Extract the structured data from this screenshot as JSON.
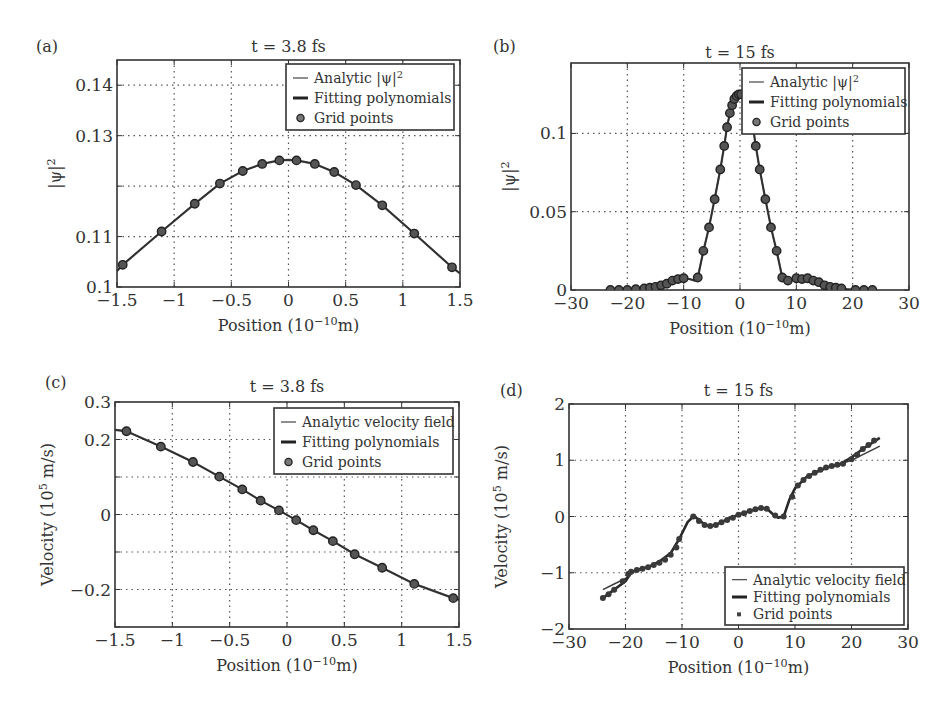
{
  "figure": {
    "panel_labels": [
      "(a)",
      "(b)",
      "(c)",
      "(d)"
    ]
  },
  "chart_data": [
    {
      "id": "a",
      "type": "line",
      "panel_label": "(a)",
      "title": "t = 3.8 fs",
      "xlabel": "Position (10",
      "xlabel_sup": "−10",
      "xlabel_tail": "m)",
      "ylabel": "|ψ|",
      "ylabel_sup": "2",
      "xlim": [
        -1.5,
        1.5
      ],
      "ylim": [
        0.1,
        0.145
      ],
      "xticks": [
        -1.5,
        -1,
        -0.5,
        0,
        0.5,
        1,
        1.5
      ],
      "xtick_labels": [
        "−1.5",
        "−1",
        "−0.5",
        "0",
        "0.5",
        "1",
        "1.5"
      ],
      "yticks": [
        0.1,
        0.11,
        0.12,
        0.13,
        0.14
      ],
      "ytick_labels": [
        "0.1",
        "0.11",
        "",
        "0.13",
        "0.14"
      ],
      "grid": true,
      "legend_position": "top-right",
      "legend": [
        {
          "label": "Analytic |ψ|",
          "sup": "2",
          "style": "thin-line"
        },
        {
          "label": "Fitting polynomials",
          "sup": "",
          "style": "thick-line"
        },
        {
          "label": "Grid points",
          "sup": "",
          "style": "marker"
        }
      ],
      "series": [
        {
          "name": "Analytic |ψ|^2",
          "kind": "curve",
          "x": [
            -1.5,
            -1.45,
            -1.11,
            -0.82,
            -0.6,
            -0.4,
            -0.23,
            -0.08,
            0.0,
            0.07,
            0.23,
            0.4,
            0.59,
            0.82,
            1.1,
            1.43,
            1.5
          ],
          "y": [
            0.1032,
            0.1044,
            0.111,
            0.1165,
            0.1205,
            0.123,
            0.1244,
            0.1251,
            0.1252,
            0.1251,
            0.1244,
            0.1228,
            0.1202,
            0.1162,
            0.1106,
            0.1039,
            0.1027
          ]
        },
        {
          "name": "Grid points",
          "kind": "points",
          "x": [
            -1.45,
            -1.11,
            -0.82,
            -0.6,
            -0.4,
            -0.23,
            -0.08,
            0.07,
            0.23,
            0.4,
            0.59,
            0.82,
            1.1,
            1.43
          ],
          "y": [
            0.1044,
            0.111,
            0.1165,
            0.1205,
            0.123,
            0.1244,
            0.1251,
            0.1251,
            0.1244,
            0.1228,
            0.1202,
            0.1162,
            0.1106,
            0.1039
          ]
        }
      ]
    },
    {
      "id": "b",
      "type": "line",
      "panel_label": "(b)",
      "title": "t = 15 fs",
      "xlabel": "Position (10",
      "xlabel_sup": "−10",
      "xlabel_tail": "m)",
      "ylabel": "|ψ|",
      "ylabel_sup": "2",
      "xlim": [
        -30,
        30
      ],
      "ylim": [
        0,
        0.145
      ],
      "xticks": [
        -30,
        -20,
        -10,
        0,
        10,
        20,
        30
      ],
      "xtick_labels": [
        "−30",
        "−20",
        "−10",
        "0",
        "10",
        "20",
        "30"
      ],
      "yticks": [
        0,
        0.05,
        0.1
      ],
      "ytick_labels": [
        "0",
        "0.05",
        "0.1"
      ],
      "grid": true,
      "legend_position": "top-right",
      "legend": [
        {
          "label": "Analytic |ψ|",
          "sup": "2",
          "style": "thin-line"
        },
        {
          "label": "Fitting polynomials",
          "sup": "",
          "style": "thick-line"
        },
        {
          "label": "Grid points",
          "sup": "",
          "style": "marker"
        }
      ],
      "series": [
        {
          "name": "Analytic |ψ|^2",
          "kind": "curve",
          "x": [
            -23,
            -21.5,
            -20,
            -18.5,
            -17,
            -16,
            -15,
            -14,
            -13,
            -12,
            -11,
            -10,
            -9,
            -8,
            -7.5,
            -6.5,
            -5.5,
            -4.5,
            -3.5,
            -2.8,
            -2.3,
            -1.8,
            -1.4,
            -1,
            -0.6,
            -0.2,
            0.2,
            0.6,
            1,
            1.4,
            1.8,
            2.3,
            2.8,
            3.5,
            4.5,
            5.5,
            6.5,
            7.5,
            8.5,
            10,
            11,
            12,
            13,
            14,
            15,
            16,
            17,
            18,
            19,
            20.5,
            22,
            23.5
          ],
          "y": [
            0,
            0,
            0,
            0.0005,
            0.001,
            0.0015,
            0.002,
            0.003,
            0.004,
            0.006,
            0.007,
            0.0075,
            0.007,
            0.006,
            0.008,
            0.025,
            0.04,
            0.058,
            0.077,
            0.092,
            0.104,
            0.113,
            0.118,
            0.122,
            0.124,
            0.125,
            0.125,
            0.124,
            0.122,
            0.118,
            0.113,
            0.104,
            0.092,
            0.077,
            0.058,
            0.04,
            0.025,
            0.008,
            0.006,
            0.0075,
            0.007,
            0.0075,
            0.006,
            0.005,
            0.003,
            0.002,
            0.0015,
            0.001,
            0.0005,
            0,
            0,
            0
          ]
        },
        {
          "name": "Grid points",
          "kind": "points",
          "x": [
            -23,
            -21.5,
            -20,
            -18.5,
            -17,
            -16,
            -15,
            -14,
            -13,
            -12,
            -11,
            -10,
            -7.5,
            -6.5,
            -5.5,
            -4.5,
            -3.5,
            -2.8,
            -2.3,
            -1.8,
            -1.4,
            -1,
            -0.6,
            -0.2,
            0.2,
            2.8,
            3.5,
            4.5,
            5.5,
            6.5,
            7.5,
            8.5,
            10,
            11,
            12,
            13,
            14,
            15,
            16,
            17,
            18,
            20.5,
            22,
            23.5
          ],
          "y": [
            0,
            0,
            0,
            0.0005,
            0.001,
            0.0015,
            0.002,
            0.003,
            0.004,
            0.006,
            0.007,
            0.0075,
            0.008,
            0.025,
            0.04,
            0.058,
            0.077,
            0.092,
            0.104,
            0.113,
            0.118,
            0.122,
            0.124,
            0.125,
            0.125,
            0.092,
            0.077,
            0.058,
            0.04,
            0.025,
            0.008,
            0.006,
            0.0075,
            0.007,
            0.0075,
            0.006,
            0.005,
            0.003,
            0.002,
            0.0015,
            0.001,
            0,
            0,
            0
          ]
        }
      ]
    },
    {
      "id": "c",
      "type": "line",
      "panel_label": "(c)",
      "title": "t = 3.8 fs",
      "xlabel": "Position (10",
      "xlabel_sup": "−10",
      "xlabel_tail": "m)",
      "ylabel": "Velocity (10",
      "ylabel_sup": "5",
      "ylabel_tail": " m/s)",
      "xlim": [
        -1.5,
        1.5
      ],
      "ylim": [
        -0.3,
        0.3
      ],
      "xticks": [
        -1.5,
        -1,
        -0.5,
        0,
        0.5,
        1,
        1.5
      ],
      "xtick_labels": [
        "−1.5",
        "−1",
        "−0.5",
        "0",
        "0.5",
        "1",
        "1.5"
      ],
      "yticks": [
        -0.3,
        -0.2,
        -0.1,
        0,
        0.1,
        0.2,
        0.3
      ],
      "ytick_labels": [
        "",
        "−0.2",
        "",
        "0",
        "",
        "0.2",
        "0.3"
      ],
      "grid": true,
      "legend_position": "top-right",
      "legend": [
        {
          "label": "Analytic velocity field",
          "sup": "",
          "style": "thin-line"
        },
        {
          "label": "Fitting polynomials",
          "sup": "",
          "style": "thick-line"
        },
        {
          "label": "Grid points",
          "sup": "",
          "style": "marker"
        }
      ],
      "series": [
        {
          "name": "Analytic velocity field",
          "kind": "curve",
          "x": [
            -1.5,
            -1.4,
            -1.1,
            -0.82,
            -0.59,
            -0.39,
            -0.23,
            -0.07,
            0.08,
            0.23,
            0.4,
            0.59,
            0.83,
            1.11,
            1.45,
            1.5
          ],
          "y": [
            0.226,
            0.222,
            0.181,
            0.14,
            0.101,
            0.067,
            0.037,
            0.011,
            -0.015,
            -0.042,
            -0.071,
            -0.106,
            -0.142,
            -0.185,
            -0.223,
            -0.227
          ]
        },
        {
          "name": "Grid points",
          "kind": "points",
          "x": [
            -1.4,
            -1.1,
            -0.82,
            -0.59,
            -0.39,
            -0.23,
            -0.07,
            0.08,
            0.23,
            0.4,
            0.59,
            0.83,
            1.11,
            1.45
          ],
          "y": [
            0.222,
            0.181,
            0.14,
            0.101,
            0.067,
            0.037,
            0.011,
            -0.015,
            -0.042,
            -0.071,
            -0.106,
            -0.142,
            -0.185,
            -0.223
          ]
        }
      ]
    },
    {
      "id": "d",
      "type": "line",
      "panel_label": "(d)",
      "title": "t = 15 fs",
      "xlabel": "Position (10",
      "xlabel_sup": "−10",
      "xlabel_tail": "m)",
      "ylabel": "Velocity (10",
      "ylabel_sup": "5",
      "ylabel_tail": " m/s)",
      "xlim": [
        -30,
        30
      ],
      "ylim": [
        -2,
        2
      ],
      "xticks": [
        -30,
        -20,
        -10,
        0,
        10,
        20,
        30
      ],
      "xtick_labels": [
        "−30",
        "−20",
        "−10",
        "0",
        "10",
        "20",
        "30"
      ],
      "yticks": [
        -2,
        -1,
        0,
        1,
        2
      ],
      "ytick_labels": [
        "−2",
        "−1",
        "0",
        "1",
        "2"
      ],
      "grid": true,
      "legend_position": "bottom-right",
      "legend": [
        {
          "label": "Analytic velocity field",
          "sup": "",
          "style": "thin-line"
        },
        {
          "label": "Fitting polynomials",
          "sup": "",
          "style": "thick-line"
        },
        {
          "label": "Grid points",
          "sup": "",
          "style": "square-marker"
        }
      ],
      "series": [
        {
          "name": "Analytic velocity field",
          "kind": "curve",
          "x": [
            -24,
            -22,
            -20,
            -19,
            -18,
            -16,
            -14,
            -12,
            -10.5,
            -9,
            -8,
            -7,
            -6,
            -5,
            -4,
            -2,
            0,
            2,
            4,
            5,
            6,
            7,
            8,
            9,
            10,
            11,
            12,
            14,
            16,
            18,
            20,
            22,
            25
          ],
          "y": [
            -1.3,
            -1.2,
            -1.1,
            -1.0,
            -0.95,
            -0.9,
            -0.8,
            -0.65,
            -0.4,
            -0.1,
            0.0,
            -0.05,
            -0.15,
            -0.17,
            -0.15,
            -0.05,
            0.03,
            0.1,
            0.15,
            0.14,
            0.05,
            -0.02,
            0.0,
            0.3,
            0.5,
            0.6,
            0.7,
            0.8,
            0.88,
            0.93,
            1.0,
            1.1,
            1.25
          ]
        },
        {
          "name": "Fitting polynomials",
          "kind": "curve",
          "x": [
            -24,
            -22,
            -20,
            -19,
            -18,
            -16,
            -14,
            -12,
            -10.5,
            -9,
            -8,
            -7,
            -6,
            -5,
            -4,
            -2,
            0,
            2,
            4,
            5,
            6,
            7,
            8,
            9,
            10,
            11,
            12,
            14,
            16,
            18,
            20,
            22,
            25
          ],
          "y": [
            -1.45,
            -1.3,
            -1.15,
            -1.0,
            -0.95,
            -0.9,
            -0.8,
            -0.65,
            -0.4,
            -0.1,
            0.0,
            -0.05,
            -0.15,
            -0.17,
            -0.15,
            -0.05,
            0.03,
            0.1,
            0.15,
            0.14,
            0.05,
            -0.02,
            0.0,
            0.3,
            0.5,
            0.6,
            0.7,
            0.8,
            0.88,
            0.93,
            1.05,
            1.2,
            1.4
          ]
        },
        {
          "name": "Grid points",
          "kind": "points",
          "x": [
            -24,
            -23,
            -22,
            -20.5,
            -19.5,
            -19,
            -18,
            -17,
            -16,
            -15,
            -14,
            -13,
            -12,
            -11,
            -10.5,
            -8,
            -7,
            -6,
            -5,
            -4,
            -3,
            -2,
            -1,
            0,
            1,
            2,
            3,
            4,
            5,
            6.5,
            8,
            9.5,
            10.5,
            11.5,
            12.5,
            13.5,
            14.5,
            15.5,
            16.5,
            17.5,
            18.5,
            20,
            21,
            22,
            23,
            24
          ],
          "y": [
            -1.45,
            -1.38,
            -1.3,
            -1.15,
            -1.02,
            -0.98,
            -0.95,
            -0.93,
            -0.9,
            -0.86,
            -0.82,
            -0.77,
            -0.68,
            -0.55,
            -0.4,
            0.0,
            -0.08,
            -0.15,
            -0.17,
            -0.15,
            -0.1,
            -0.06,
            -0.02,
            0.03,
            0.06,
            0.1,
            0.13,
            0.15,
            0.14,
            0.02,
            0.0,
            0.35,
            0.55,
            0.65,
            0.72,
            0.78,
            0.83,
            0.87,
            0.9,
            0.92,
            0.94,
            1.02,
            1.1,
            1.2,
            1.27,
            1.35
          ]
        }
      ]
    }
  ]
}
